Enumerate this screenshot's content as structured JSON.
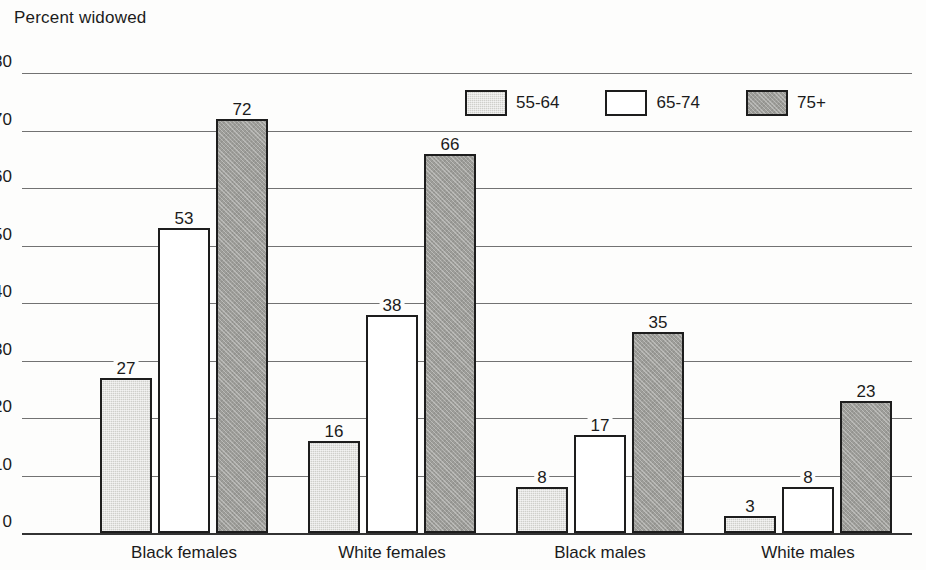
{
  "chart_data": {
    "type": "bar",
    "title": "Percent widowed",
    "xlabel": "",
    "ylabel": "Percent widowed",
    "ylim": [
      0,
      80
    ],
    "ytick_step": 10,
    "yticks": [
      "0",
      "10",
      "20",
      "30",
      "40",
      "50",
      "60",
      "70",
      "80"
    ],
    "grid": true,
    "legend_position": "top-right",
    "categories": [
      "Black females",
      "White females",
      "Black males",
      "White males"
    ],
    "series": [
      {
        "name": "55-64",
        "color": "#cfcfcb",
        "values": [
          27,
          16,
          8,
          3
        ]
      },
      {
        "name": "65-74",
        "color": "#ffffff",
        "values": [
          53,
          38,
          17,
          8
        ]
      },
      {
        "name": "75+",
        "color": "#9d9d99",
        "values": [
          72,
          66,
          35,
          23
        ]
      }
    ],
    "data_labels": [
      [
        "27",
        "53",
        "72"
      ],
      [
        "16",
        "38",
        "66"
      ],
      [
        "8",
        "17",
        "35"
      ],
      [
        "3",
        "8",
        "23"
      ]
    ],
    "colors": {
      "bar_outline": "#1d1d1d",
      "gridline": "#4a4a4a",
      "axis": "#333333",
      "text": "#1b1b1b",
      "background": "#fdfdfc"
    }
  }
}
